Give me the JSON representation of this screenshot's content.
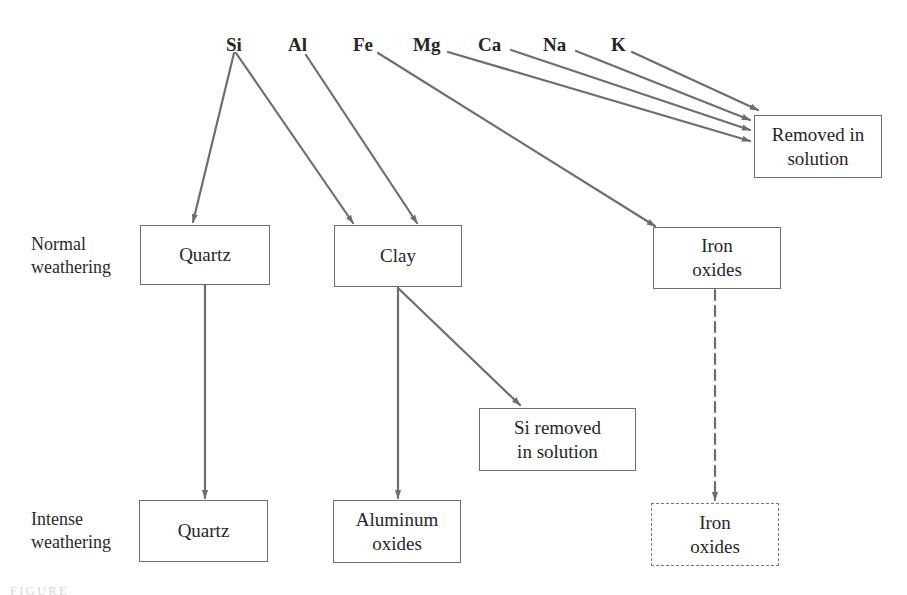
{
  "diagram": {
    "elements": [
      {
        "id": "si",
        "label": "Si"
      },
      {
        "id": "al",
        "label": "Al"
      },
      {
        "id": "fe",
        "label": "Fe"
      },
      {
        "id": "mg",
        "label": "Mg"
      },
      {
        "id": "ca",
        "label": "Ca"
      },
      {
        "id": "na",
        "label": "Na"
      },
      {
        "id": "k",
        "label": "K"
      }
    ],
    "row_labels": {
      "normal": "Normal\nweathering",
      "intense": "Intense\nweathering"
    },
    "boxes": {
      "removed_in_solution": "Removed in\nsolution",
      "quartz_normal": "Quartz",
      "clay": "Clay",
      "iron_oxides_normal": "Iron\noxides",
      "si_removed": "Si  removed\nin solution",
      "quartz_intense": "Quartz",
      "aluminum_oxides": "Aluminum\noxides",
      "iron_oxides_intense": "Iron\noxides"
    },
    "edges": [
      {
        "from": "Si",
        "to": "Quartz (normal)",
        "style": "solid"
      },
      {
        "from": "Si",
        "to": "Clay",
        "style": "solid"
      },
      {
        "from": "Al",
        "to": "Clay",
        "style": "solid"
      },
      {
        "from": "Fe",
        "to": "Iron oxides (normal)",
        "style": "solid"
      },
      {
        "from": "Mg",
        "to": "Removed in solution",
        "style": "solid"
      },
      {
        "from": "Ca",
        "to": "Removed in solution",
        "style": "solid"
      },
      {
        "from": "Na",
        "to": "Removed in solution",
        "style": "solid"
      },
      {
        "from": "K",
        "to": "Removed in solution",
        "style": "solid"
      },
      {
        "from": "Quartz (normal)",
        "to": "Quartz (intense)",
        "style": "solid"
      },
      {
        "from": "Clay",
        "to": "Aluminum oxides",
        "style": "solid"
      },
      {
        "from": "Clay",
        "to": "Si removed in solution",
        "style": "solid"
      },
      {
        "from": "Iron oxides (normal)",
        "to": "Iron oxides (intense)",
        "style": "dashed"
      }
    ],
    "colors": {
      "arrow": "#6e6e6e",
      "box_border": "#6e6e6e",
      "text": "#262626"
    },
    "caption_fragment": "FIGURE"
  }
}
